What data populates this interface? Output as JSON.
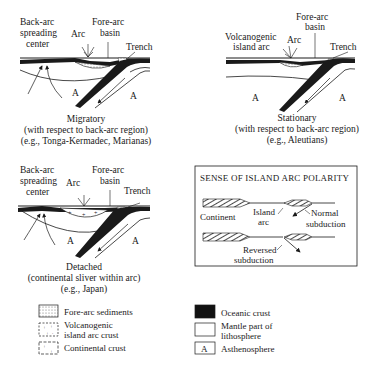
{
  "panels": {
    "migratory": {
      "labels": {
        "back_arc_1": "Back-arc",
        "back_arc_2": "spreading",
        "back_arc_3": "center",
        "arc": "Arc",
        "fore_arc_1": "Fore-arc",
        "fore_arc_2": "basin",
        "trench": "Trench",
        "a_left": "A",
        "a_right": "A"
      },
      "caption": [
        "Migratory",
        "(with respect to back-arc region)",
        "(e.g., Tonga-Kermadec, Marianas)"
      ]
    },
    "stationary": {
      "labels": {
        "volc_1": "Volcanogenic",
        "volc_2": "island arc",
        "arc": "Arc",
        "fore_arc_1": "Fore-arc",
        "fore_arc_2": "basin",
        "trench": "Trench",
        "a_left": "A",
        "a_right": "A"
      },
      "caption": [
        "Stationary",
        "(with respect to back-arc region)",
        "(e.g., Aleutians)"
      ]
    },
    "detached": {
      "labels": {
        "back_arc_1": "Back-arc",
        "back_arc_2": "spreading",
        "back_arc_3": "center",
        "arc": "Arc",
        "fore_arc_1": "Fore-arc",
        "fore_arc_2": "basin",
        "trench": "Trench",
        "a_left": "A",
        "a_right": "A"
      },
      "caption": [
        "Detached",
        "(continental sliver within arc)",
        "(e.g., Japan)"
      ]
    }
  },
  "polarity_box": {
    "title": "SENSE OF ISLAND ARC POLARITY",
    "continent": "Continent",
    "island_1": "Island",
    "island_2": "arc",
    "normal_1": "Normal",
    "normal_2": "subduction",
    "reversed_1": "Reversed",
    "reversed_2": "subduction"
  },
  "legend": {
    "left": [
      {
        "swatch": "fore-arc-sediments",
        "line1": "Fore-arc sediments",
        "line2": ""
      },
      {
        "swatch": "volcanogenic-crust",
        "line1": "Volcanogenic",
        "line2": "island arc crust"
      },
      {
        "swatch": "continental-crust",
        "line1": "Continental crust",
        "line2": ""
      }
    ],
    "right": [
      {
        "swatch": "oceanic-crust",
        "line1": "Oceanic crust",
        "line2": ""
      },
      {
        "swatch": "mantle-lithosphere",
        "line1": "Mantle part of",
        "line2": "lithosphere"
      },
      {
        "swatch": "asthenosphere",
        "symbol": "A",
        "line1": "Asthenosphere",
        "line2": ""
      }
    ]
  }
}
